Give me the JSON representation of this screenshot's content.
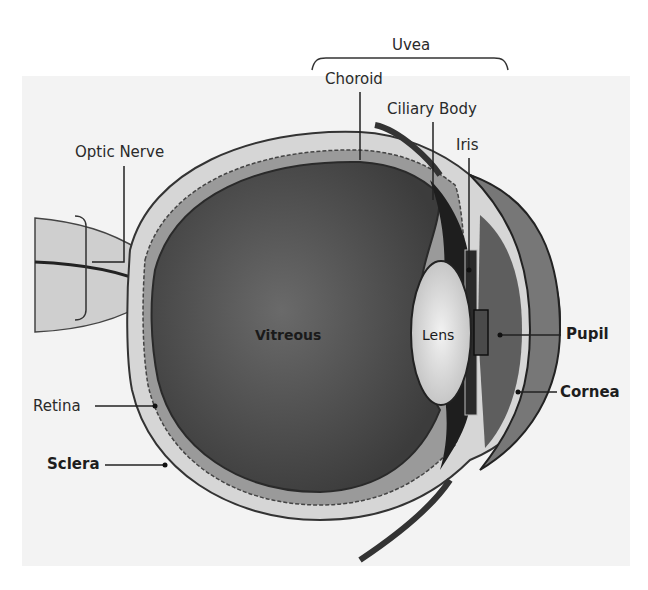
{
  "diagram": {
    "group_label": "Uvea",
    "labels": {
      "uvea": "Uvea",
      "choroid": "Choroid",
      "ciliary_body": "Ciliary Body",
      "iris": "Iris",
      "optic_nerve": "Optic Nerve",
      "vitreous": "Vitreous",
      "lens": "Lens",
      "pupil": "Pupil",
      "cornea": "Cornea",
      "retina": "Retina",
      "sclera": "Sclera"
    },
    "colors": {
      "background": "#ffffff",
      "panel": "#f3f3f3",
      "vitreous": "#5a5a5a",
      "sclera": "#d2d2d2",
      "lens": "#e4e4e4",
      "text": "#2a2a2a"
    }
  }
}
